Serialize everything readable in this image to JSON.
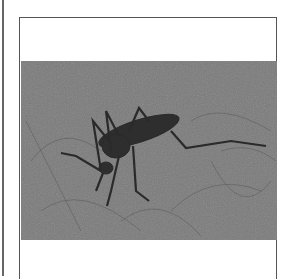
{
  "figure": {
    "image_subject": "mosquito on skin",
    "image_alt": "Photograph of a mosquito resting on hairy skin",
    "style": "grayscale halftone scan"
  },
  "colors": {
    "border": "#555555",
    "photo_bg": "#7c7c7c",
    "insect": "#2a2a2a"
  }
}
